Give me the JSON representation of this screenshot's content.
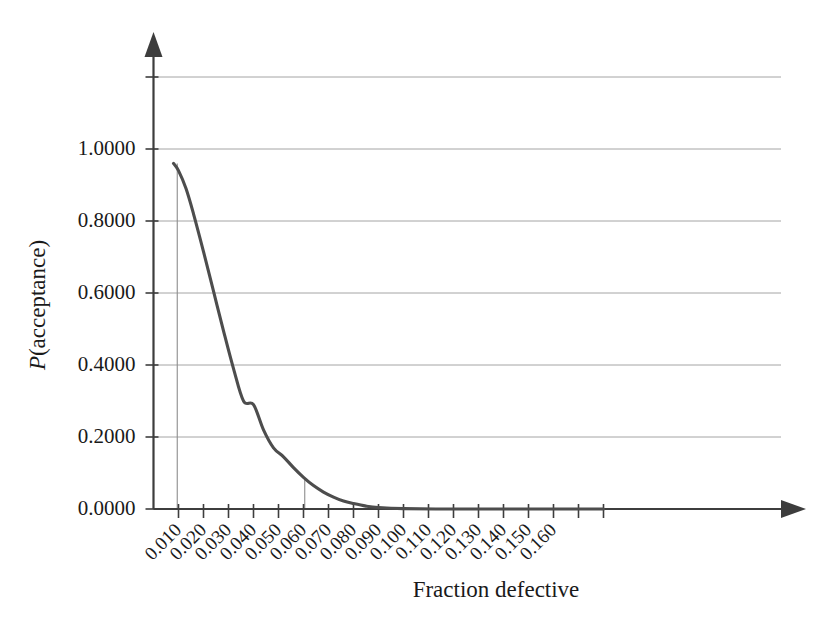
{
  "chart_data": {
    "type": "line",
    "title": "",
    "xlabel": "Fraction defective",
    "ylabel": "P(acceptance)",
    "ylabel_italic_prefix": "P",
    "ylabel_rest": "(acceptance)",
    "xlim": [
      0.0,
      0.185
    ],
    "ylim": [
      0.0,
      1.25
    ],
    "grid": true,
    "legend": "none",
    "x_tick_labels": [
      "0.010",
      "0.020",
      "0.030",
      "0.040",
      "0.050",
      "0.060",
      "0.070",
      "0.080",
      "0.090",
      "0.100",
      "0.110",
      "0.120",
      "0.130",
      "0.140",
      "0.150",
      "0.160"
    ],
    "x_tick_values": [
      0.01,
      0.02,
      0.03,
      0.04,
      0.05,
      0.06,
      0.07,
      0.08,
      0.09,
      0.1,
      0.11,
      0.12,
      0.13,
      0.14,
      0.15,
      0.16
    ],
    "x_extra_unlabeled_ticks": [
      0.17,
      0.18
    ],
    "x_tick_rotation_deg": 45,
    "y_tick_labels": [
      "0.0000",
      "0.2000",
      "0.4000",
      "0.6000",
      "0.8000",
      "1.0000"
    ],
    "y_tick_values": [
      0.0,
      0.2,
      0.4,
      0.6,
      0.8,
      1.0
    ],
    "y_extra_gridlines": [
      1.2
    ],
    "series": [
      {
        "name": "OC curve",
        "color": "#4d4d4d",
        "x": [
          0.008,
          0.01,
          0.013,
          0.016,
          0.02,
          0.024,
          0.028,
          0.032,
          0.036,
          0.04,
          0.044,
          0.048,
          0.052,
          0.056,
          0.06,
          0.064,
          0.068,
          0.072,
          0.076,
          0.08,
          0.085,
          0.09,
          0.1,
          0.12,
          0.14,
          0.16,
          0.18
        ],
        "y": [
          0.96,
          0.94,
          0.89,
          0.82,
          0.715,
          0.605,
          0.495,
          0.39,
          0.3,
          0.29,
          0.22,
          0.17,
          0.145,
          0.115,
          0.088,
          0.065,
          0.047,
          0.033,
          0.022,
          0.015,
          0.008,
          0.004,
          0.001,
          0.0,
          0.0,
          0.0,
          0.0
        ]
      }
    ],
    "reference_lines": [
      {
        "name": "aql-reference",
        "x": 0.0095,
        "y_top": 0.96
      },
      {
        "name": "ltpd-reference",
        "x": 0.0605,
        "y_top": 0.086
      }
    ]
  }
}
